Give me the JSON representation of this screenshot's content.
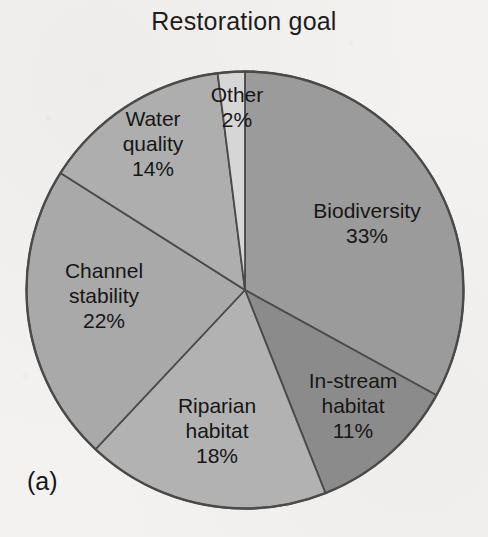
{
  "chart_data": {
    "type": "pie",
    "title": "Restoration goal",
    "panel_label": "(a)",
    "value_suffix": "%",
    "start_angle_deg": 0,
    "direction": "clockwise",
    "legend": "none (labels placed on slices)",
    "categories": [
      "Biodiversity",
      "In-stream habitat",
      "Riparian habitat",
      "Channel stability",
      "Water quality",
      "Other"
    ],
    "values": [
      33,
      11,
      18,
      22,
      14,
      2
    ],
    "colors": [
      "#9b9b9b",
      "#8b8b8b",
      "#b2b2b2",
      "#a9a9a9",
      "#aeaeae",
      "#d6d6d6"
    ],
    "slices": [
      {
        "label": "Biodiversity",
        "label_line1": "Biodiversity",
        "value": 33,
        "value_text": "33%",
        "color": "#9b9b9b"
      },
      {
        "label": "In-stream habitat",
        "label_line1": "In-stream",
        "label_line2": "habitat",
        "value": 11,
        "value_text": "11%",
        "color": "#8b8b8b"
      },
      {
        "label": "Riparian habitat",
        "label_line1": "Riparian",
        "label_line2": "habitat",
        "value": 18,
        "value_text": "18%",
        "color": "#b2b2b2"
      },
      {
        "label": "Channel stability",
        "label_line1": "Channel",
        "label_line2": "stability",
        "value": 22,
        "value_text": "22%",
        "color": "#a9a9a9"
      },
      {
        "label": "Water quality",
        "label_line1": "Water",
        "label_line2": "quality",
        "value": 14,
        "value_text": "14%",
        "color": "#aeaeae"
      },
      {
        "label": "Other",
        "label_line1": "Other",
        "value": 2,
        "value_text": "2%",
        "color": "#d6d6d6"
      }
    ],
    "xlabel": "",
    "ylabel": "",
    "grid": false,
    "outline_color": "#4a4a4a",
    "background": "#f4f2f0"
  },
  "figure": {
    "title": "Restoration goal",
    "caption": "(a)"
  }
}
